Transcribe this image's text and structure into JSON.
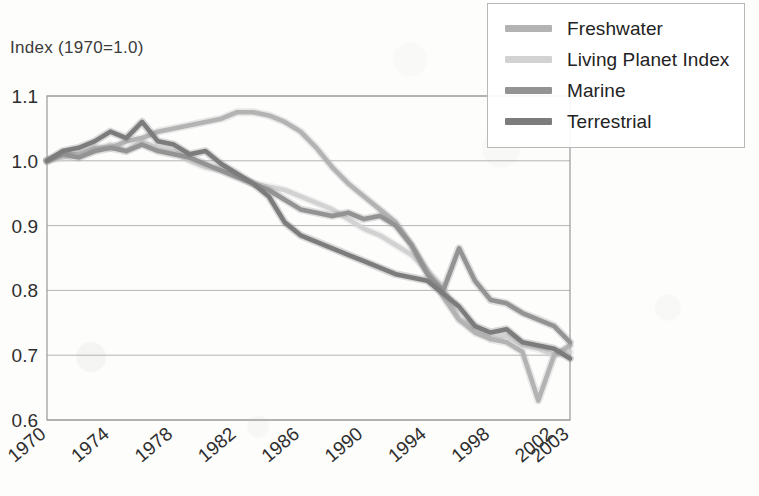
{
  "figure": {
    "axis_title": "Index (1970=1.0)",
    "background_color": "#fdfdfc",
    "frame_color": "#9a9a9a",
    "gridline_color": "#b4b4b4"
  },
  "legend": {
    "position": "top-right",
    "entries": [
      {
        "label": "Freshwater",
        "color": "#b3b3b3"
      },
      {
        "label": "Living Planet Index",
        "color": "#d2d2d2"
      },
      {
        "label": "Marine",
        "color": "#939393"
      },
      {
        "label": "Terrestrial",
        "color": "#7c7c7c"
      }
    ]
  },
  "chart_data": {
    "type": "line",
    "title": "",
    "subtitle": "",
    "xlabel": "",
    "ylabel": "Index (1970=1.0)",
    "xlim": [
      1970,
      2003
    ],
    "ylim": [
      0.6,
      1.1
    ],
    "grid": true,
    "legend_position": "top-right",
    "x_tick_labels": [
      "1970",
      "1974",
      "1978",
      "1982",
      "1986",
      "1990",
      "1994",
      "1998",
      "2002",
      "2003"
    ],
    "x_tick_values": [
      1970,
      1974,
      1978,
      1982,
      1986,
      1990,
      1994,
      1998,
      2002,
      2003
    ],
    "y_tick_labels": [
      "0.6",
      "0.7",
      "0.8",
      "0.9",
      "1.0",
      "1.1"
    ],
    "y_tick_values": [
      0.6,
      0.7,
      0.8,
      0.9,
      1.0,
      1.1
    ],
    "x": [
      1970,
      1971,
      1972,
      1973,
      1974,
      1975,
      1976,
      1977,
      1978,
      1979,
      1980,
      1981,
      1982,
      1983,
      1984,
      1985,
      1986,
      1987,
      1988,
      1989,
      1990,
      1991,
      1992,
      1993,
      1994,
      1995,
      1996,
      1997,
      1998,
      1999,
      2000,
      2001,
      2002,
      2003
    ],
    "series": [
      {
        "name": "Freshwater",
        "color": "#b3b3b3",
        "values": [
          1.0,
          1.01,
          1.01,
          1.02,
          1.02,
          1.03,
          1.035,
          1.045,
          1.05,
          1.055,
          1.06,
          1.065,
          1.075,
          1.075,
          1.07,
          1.06,
          1.045,
          1.02,
          0.99,
          0.965,
          0.945,
          0.925,
          0.905,
          0.87,
          0.83,
          0.79,
          0.755,
          0.735,
          0.725,
          0.72,
          0.705,
          0.63,
          0.7,
          0.715
        ]
      },
      {
        "name": "Living Planet Index",
        "color": "#d2d2d2",
        "values": [
          1.0,
          1.005,
          1.01,
          1.015,
          1.025,
          1.015,
          1.03,
          1.02,
          1.015,
          1.0,
          0.99,
          0.985,
          0.975,
          0.965,
          0.96,
          0.955,
          0.945,
          0.935,
          0.925,
          0.91,
          0.895,
          0.885,
          0.87,
          0.855,
          0.83,
          0.805,
          0.755,
          0.745,
          0.725,
          0.73,
          0.715,
          0.71,
          0.7,
          0.705
        ]
      },
      {
        "name": "Marine",
        "color": "#939393",
        "values": [
          1.0,
          1.01,
          1.005,
          1.015,
          1.02,
          1.015,
          1.025,
          1.015,
          1.01,
          1.005,
          0.995,
          0.985,
          0.975,
          0.965,
          0.955,
          0.94,
          0.925,
          0.92,
          0.915,
          0.92,
          0.91,
          0.915,
          0.9,
          0.87,
          0.825,
          0.8,
          0.865,
          0.815,
          0.785,
          0.78,
          0.765,
          0.755,
          0.745,
          0.72
        ]
      },
      {
        "name": "Terrestrial",
        "color": "#7c7c7c",
        "values": [
          1.0,
          1.015,
          1.02,
          1.03,
          1.045,
          1.035,
          1.06,
          1.03,
          1.025,
          1.01,
          1.015,
          0.995,
          0.98,
          0.965,
          0.945,
          0.905,
          0.885,
          0.875,
          0.865,
          0.855,
          0.845,
          0.835,
          0.825,
          0.82,
          0.815,
          0.795,
          0.775,
          0.745,
          0.735,
          0.74,
          0.72,
          0.715,
          0.71,
          0.695
        ]
      }
    ]
  }
}
